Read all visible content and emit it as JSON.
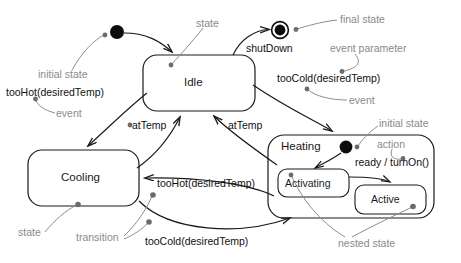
{
  "diagram": {
    "type": "state-machine",
    "states": {
      "idle": "Idle",
      "cooling": "Cooling",
      "heating": "Heating",
      "activating": "Activating",
      "active": "Active"
    },
    "transitions": {
      "shutdown": "shutDown",
      "too_cold_right": "tooCold(desiredTemp)",
      "too_hot_left": "tooHot(desiredTemp)",
      "at_temp_left": "atTemp",
      "at_temp_right": "atTemp",
      "too_hot_mid": "tooHot(desiredTemp)",
      "too_cold_bottom": "tooCold(desiredTemp)",
      "ready_turn_on": "ready / turnOn()"
    },
    "annotations": {
      "initial_state_top": "initial state",
      "state_top": "state",
      "final_state": "final state",
      "event_parameter": "event parameter",
      "event_right": "event",
      "event_left": "event",
      "initial_state_heating": "initial state",
      "action": "action",
      "state_cooling": "state",
      "transition": "transition",
      "nested_state": "nested state"
    },
    "colors": {
      "stroke": "#1a1a1a",
      "annotation": "#8a8a8a",
      "callout": "#8d8d8d",
      "background": "#ffffff"
    }
  }
}
